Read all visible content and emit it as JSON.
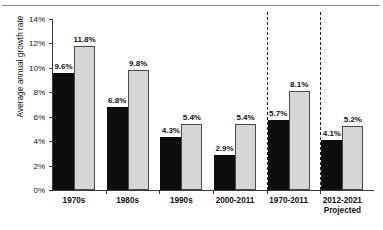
{
  "chart_data": {
    "type": "bar",
    "title": "",
    "xlabel": "",
    "ylabel": "Average annual growth rate",
    "ylim": [
      0,
      14
    ],
    "ytick_labels": [
      "0%",
      "2%",
      "4%",
      "6%",
      "8%",
      "10%",
      "12%",
      "14%"
    ],
    "ytick_values": [
      0,
      2,
      4,
      6,
      8,
      10,
      12,
      14
    ],
    "grid": false,
    "legend": "none",
    "categories": [
      "1970s",
      "1980s",
      "1990s",
      "2000-2011",
      "1970-2011",
      "2012-2021"
    ],
    "category_sublabels": [
      "",
      "",
      "",
      "",
      "",
      "Projected"
    ],
    "series": [
      {
        "name": "dark",
        "values": [
          9.6,
          6.8,
          4.3,
          2.9,
          5.7,
          4.1
        ],
        "color": "#0d0d0d"
      },
      {
        "name": "light",
        "values": [
          11.8,
          9.8,
          5.4,
          5.4,
          8.1,
          5.2
        ],
        "color": "#d6d6d6"
      }
    ],
    "value_labels": {
      "dark": [
        "9.6%",
        "6.8%",
        "4.3%",
        "2.9%",
        "5.7%",
        "4.1%"
      ],
      "light": [
        "11.8%",
        "9.8%",
        "5.4%",
        "5.4%",
        "8.1%",
        "5.2%"
      ]
    },
    "separators_after_category_index": [
      3,
      4
    ],
    "separator_style": "dashed"
  }
}
